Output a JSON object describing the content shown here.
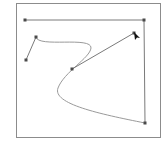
{
  "canvas": {
    "width": 168,
    "height": 146,
    "background": "#ffffff",
    "frame": {
      "x": 16.5,
      "y": 3.5,
      "width": 144,
      "height": 134,
      "stroke": "#8c8c8c"
    }
  },
  "colors": {
    "line": "#7a7a7a",
    "curve": "#9a9a9a",
    "node": "#4a4a4a",
    "cursor": "#111111"
  },
  "shapes": {
    "polyline": {
      "points": [
        [
          25,
          20
        ],
        [
          144,
          20
        ],
        [
          145,
          123
        ]
      ]
    },
    "bezier_path": {
      "d": "M36,37 C38,48 92,36 91,48 C90,58 64,72 58,88 C52,104 100,114 145,123"
    },
    "handle_a": {
      "from": [
        36,
        37
      ],
      "to": [
        26,
        60
      ]
    },
    "handle_b": {
      "from": [
        72,
        69
      ],
      "to": [
        134,
        33
      ]
    }
  },
  "nodes": [
    {
      "name": "node-top-left",
      "x": 25,
      "y": 20
    },
    {
      "name": "node-top-right",
      "x": 144,
      "y": 20
    },
    {
      "name": "node-bottom-right",
      "x": 145,
      "y": 123
    },
    {
      "name": "node-curve-start",
      "x": 36,
      "y": 37
    },
    {
      "name": "node-handle-a-end",
      "x": 26,
      "y": 60
    },
    {
      "name": "node-curve-mid",
      "x": 72,
      "y": 69
    },
    {
      "name": "node-handle-b-end",
      "x": 134,
      "y": 33
    }
  ],
  "cursor": {
    "icon": "arrow-pointer-icon",
    "x": 134,
    "y": 32
  }
}
